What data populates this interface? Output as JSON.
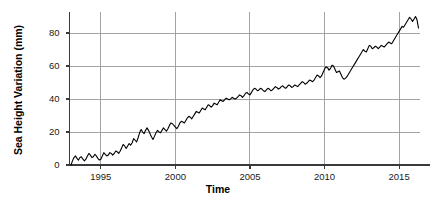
{
  "chart_data": {
    "type": "line",
    "title": "",
    "xlabel": "Time",
    "ylabel": "Sea Height Variation (mm)",
    "xlim": [
      1992.9,
      2016.4
    ],
    "ylim": [
      -2,
      93
    ],
    "xticks": [
      1995,
      2000,
      2005,
      2010,
      2015
    ],
    "xtick_labels": [
      "1995",
      "2000",
      "2005",
      "2010",
      "2015"
    ],
    "yticks": [
      0,
      20,
      40,
      60,
      80
    ],
    "ytick_labels": [
      "0",
      "20",
      "40",
      "60",
      "80"
    ],
    "grid": "horizontal-and-vertical",
    "legend": "none",
    "line_color": "#000000",
    "grid_color": "#9a9a9a",
    "axis_color": "#3a3a3a",
    "series": [
      {
        "name": "Sea Height Variation",
        "x": [
          1993.0,
          1993.1,
          1993.2,
          1993.3,
          1993.4,
          1993.5,
          1993.6,
          1993.7,
          1993.8,
          1993.9,
          1994.0,
          1994.1,
          1994.2,
          1994.3,
          1994.4,
          1994.5,
          1994.6,
          1994.7,
          1994.8,
          1994.9,
          1995.0,
          1995.1,
          1995.2,
          1995.3,
          1995.4,
          1995.5,
          1995.6,
          1995.7,
          1995.8,
          1995.9,
          1996.0,
          1996.1,
          1996.2,
          1996.3,
          1996.4,
          1996.5,
          1996.6,
          1996.7,
          1996.8,
          1996.9,
          1997.0,
          1997.1,
          1997.2,
          1997.3,
          1997.4,
          1997.5,
          1997.6,
          1997.7,
          1997.8,
          1997.9,
          1998.0,
          1998.1,
          1998.2,
          1998.3,
          1998.4,
          1998.5,
          1998.6,
          1998.7,
          1998.8,
          1998.9,
          1999.0,
          1999.1,
          1999.2,
          1999.3,
          1999.4,
          1999.5,
          1999.6,
          1999.7,
          1999.8,
          1999.9,
          2000.0,
          2000.1,
          2000.2,
          2000.3,
          2000.4,
          2000.5,
          2000.6,
          2000.7,
          2000.8,
          2000.9,
          2001.0,
          2001.1,
          2001.2,
          2001.3,
          2001.4,
          2001.5,
          2001.6,
          2001.7,
          2001.8,
          2001.9,
          2002.0,
          2002.1,
          2002.2,
          2002.3,
          2002.4,
          2002.5,
          2002.6,
          2002.7,
          2002.8,
          2002.9,
          2003.0,
          2003.1,
          2003.2,
          2003.3,
          2003.4,
          2003.5,
          2003.6,
          2003.7,
          2003.8,
          2003.9,
          2004.0,
          2004.1,
          2004.2,
          2004.3,
          2004.4,
          2004.5,
          2004.6,
          2004.7,
          2004.8,
          2004.9,
          2005.0,
          2005.1,
          2005.2,
          2005.3,
          2005.4,
          2005.5,
          2005.6,
          2005.7,
          2005.8,
          2005.9,
          2006.0,
          2006.1,
          2006.2,
          2006.3,
          2006.4,
          2006.5,
          2006.6,
          2006.7,
          2006.8,
          2006.9,
          2007.0,
          2007.1,
          2007.2,
          2007.3,
          2007.4,
          2007.5,
          2007.6,
          2007.7,
          2007.8,
          2007.9,
          2008.0,
          2008.1,
          2008.2,
          2008.3,
          2008.4,
          2008.5,
          2008.6,
          2008.7,
          2008.8,
          2008.9,
          2009.0,
          2009.1,
          2009.2,
          2009.3,
          2009.4,
          2009.5,
          2009.6,
          2009.7,
          2009.8,
          2009.9,
          2010.0,
          2010.1,
          2010.2,
          2010.3,
          2010.4,
          2010.5,
          2010.6,
          2010.7,
          2010.8,
          2010.9,
          2011.0,
          2011.1,
          2011.2,
          2011.3,
          2011.4,
          2011.5,
          2011.6,
          2011.7,
          2011.8,
          2011.9,
          2012.0,
          2012.1,
          2012.2,
          2012.3,
          2012.4,
          2012.5,
          2012.6,
          2012.7,
          2012.8,
          2012.9,
          2013.0,
          2013.1,
          2013.2,
          2013.3,
          2013.4,
          2013.5,
          2013.6,
          2013.7,
          2013.8,
          2013.9,
          2014.0,
          2014.1,
          2014.2,
          2014.3,
          2014.4,
          2014.5,
          2014.6,
          2014.7,
          2014.8,
          2014.9,
          2015.0,
          2015.1,
          2015.2,
          2015.3,
          2015.4,
          2015.5,
          2015.6,
          2015.7,
          2015.8,
          2015.9,
          2016.0,
          2016.1,
          2016.2,
          2016.3
        ],
        "y": [
          0.0,
          2.5,
          4.5,
          5.5,
          4.0,
          3.0,
          4.5,
          5.0,
          3.5,
          2.5,
          3.5,
          5.5,
          7.0,
          6.0,
          4.5,
          5.0,
          6.5,
          5.5,
          4.0,
          3.0,
          3.5,
          5.5,
          7.5,
          6.5,
          5.5,
          6.0,
          7.5,
          7.0,
          6.0,
          7.0,
          8.5,
          8.0,
          7.0,
          8.5,
          10.5,
          12.5,
          11.5,
          10.0,
          11.5,
          13.0,
          12.0,
          13.5,
          16.0,
          15.0,
          14.0,
          16.5,
          19.5,
          21.5,
          20.0,
          19.0,
          21.0,
          22.5,
          21.0,
          19.0,
          17.0,
          15.5,
          17.5,
          19.5,
          21.0,
          20.0,
          19.5,
          21.0,
          22.5,
          21.5,
          20.5,
          22.0,
          24.0,
          25.5,
          25.0,
          24.0,
          23.0,
          22.0,
          23.5,
          25.5,
          26.5,
          26.0,
          25.5,
          27.0,
          28.5,
          29.5,
          29.0,
          28.0,
          29.5,
          31.0,
          32.5,
          32.0,
          31.5,
          33.0,
          34.5,
          34.0,
          33.5,
          35.0,
          36.5,
          36.0,
          35.0,
          36.0,
          37.5,
          37.0,
          36.5,
          38.0,
          39.5,
          39.0,
          38.5,
          39.5,
          40.5,
          40.0,
          39.5,
          40.0,
          41.0,
          40.5,
          40.0,
          40.5,
          41.5,
          42.5,
          42.0,
          41.0,
          42.0,
          43.5,
          44.0,
          43.0,
          42.5,
          44.0,
          45.5,
          46.5,
          46.0,
          45.0,
          45.5,
          46.5,
          46.0,
          45.0,
          44.5,
          45.5,
          46.5,
          46.0,
          45.0,
          45.5,
          46.5,
          47.5,
          47.0,
          46.0,
          46.5,
          47.5,
          48.0,
          47.0,
          46.5,
          47.5,
          48.5,
          48.0,
          47.0,
          47.5,
          48.5,
          48.0,
          47.5,
          48.5,
          49.5,
          50.5,
          50.0,
          49.0,
          49.5,
          50.5,
          51.5,
          51.0,
          50.5,
          51.5,
          53.0,
          54.5,
          54.0,
          53.0,
          54.0,
          56.0,
          58.0,
          59.5,
          59.0,
          57.5,
          58.5,
          60.5,
          60.0,
          58.0,
          56.0,
          56.5,
          57.0,
          55.0,
          53.0,
          52.0,
          52.5,
          53.5,
          55.0,
          56.5,
          58.0,
          59.5,
          61.0,
          62.5,
          64.0,
          65.5,
          67.0,
          68.5,
          70.0,
          69.0,
          68.5,
          70.5,
          72.5,
          72.0,
          70.5,
          71.0,
          72.0,
          71.5,
          70.5,
          71.5,
          72.5,
          72.0,
          71.5,
          72.5,
          73.5,
          74.5,
          74.0,
          73.5,
          75.0,
          76.5,
          78.0,
          79.5,
          81.0,
          82.5,
          84.0,
          83.5,
          85.0,
          86.5,
          88.0,
          89.5,
          88.5,
          87.0,
          88.5,
          90.0,
          88.0,
          83.0
        ]
      }
    ]
  },
  "axes": {
    "ylabel": "Sea Height Variation (mm)",
    "xlabel": "Time"
  }
}
